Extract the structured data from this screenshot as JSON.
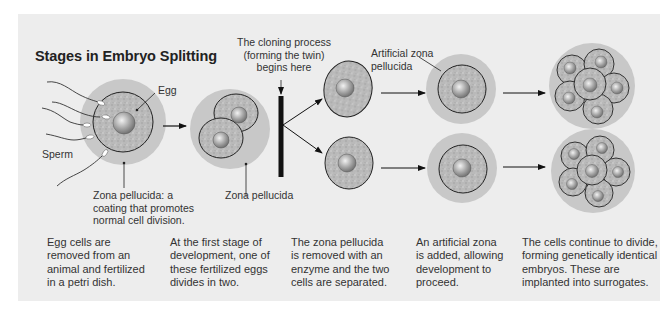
{
  "title": "Stages in Embryo Splitting",
  "labels": {
    "egg": "Egg",
    "sperm": "Sperm",
    "zona_note": [
      "Zona pellucida: a",
      "coating that promotes",
      "normal cell division."
    ],
    "zona": "Zona pellucida",
    "cloning": [
      "The cloning process",
      "(forming the twin)",
      "begins here"
    ],
    "artificial_zona": [
      "Artificial zona",
      "pellucida"
    ]
  },
  "captions": [
    [
      "Egg cells are",
      "removed from an",
      "animal and fertilized",
      "in a petri dish."
    ],
    [
      "At the first stage of",
      "development, one of",
      "these fertilized eggs",
      "divides in two."
    ],
    [
      "The zona pellucida",
      "is removed with an",
      "enzyme and the two",
      "cells are separated."
    ],
    [
      "An artificial zona",
      "is added, allowing",
      "development to",
      "proceed."
    ],
    [
      "The cells continue to divide,",
      "forming genetically identical",
      "embryos. These are",
      "implanted into surrogates."
    ]
  ],
  "colors": {
    "panel": "#ededed",
    "zona": "#c9c9c9",
    "cytoplasm": "#b5b5b5",
    "nucleus": "#9a9a9a",
    "line": "#222222"
  }
}
